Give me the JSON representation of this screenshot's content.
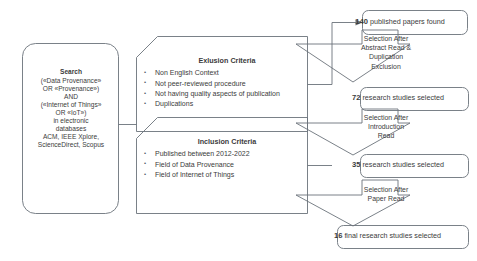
{
  "diagram": {
    "colors": {
      "stroke": "#6b737b",
      "text": "#3b3b3b",
      "background": "#ffffff"
    },
    "search_box": {
      "heading": "Search",
      "lines": [
        "(«Data Provenance»",
        "OR «Provenance»)",
        "AND",
        "(«Internet of Things»",
        "OR «IoT»)",
        "in electronic",
        "databases",
        "ACM, IEEE Xplore,",
        "ScienceDirect, Scopus"
      ]
    },
    "exclusion": {
      "title": "Exlusion Criteria",
      "items": [
        "Non English Context",
        "Not peer-reviewed procedure",
        "Not having quality aspects of publication",
        "Duplications"
      ]
    },
    "inclusion": {
      "title": "Inclusion Criteria",
      "items": [
        "Published between 2012-2022",
        "Field of Data Provenance",
        "Field of Internet of Things"
      ]
    },
    "results": [
      {
        "count": "140",
        "label": "published papers found"
      },
      {
        "count": "72",
        "label": "research studies selected"
      },
      {
        "count": "35",
        "label": "research studies selected"
      },
      {
        "count": "16",
        "label": "final research studies selected"
      }
    ],
    "steps": [
      {
        "lines": [
          "Selection After",
          "Abstract Read &",
          "Duplication",
          "Exclusion"
        ]
      },
      {
        "lines": [
          "Selection After",
          "Introduction",
          "Read"
        ]
      },
      {
        "lines": [
          "Selection After",
          "Paper Read"
        ]
      }
    ]
  }
}
